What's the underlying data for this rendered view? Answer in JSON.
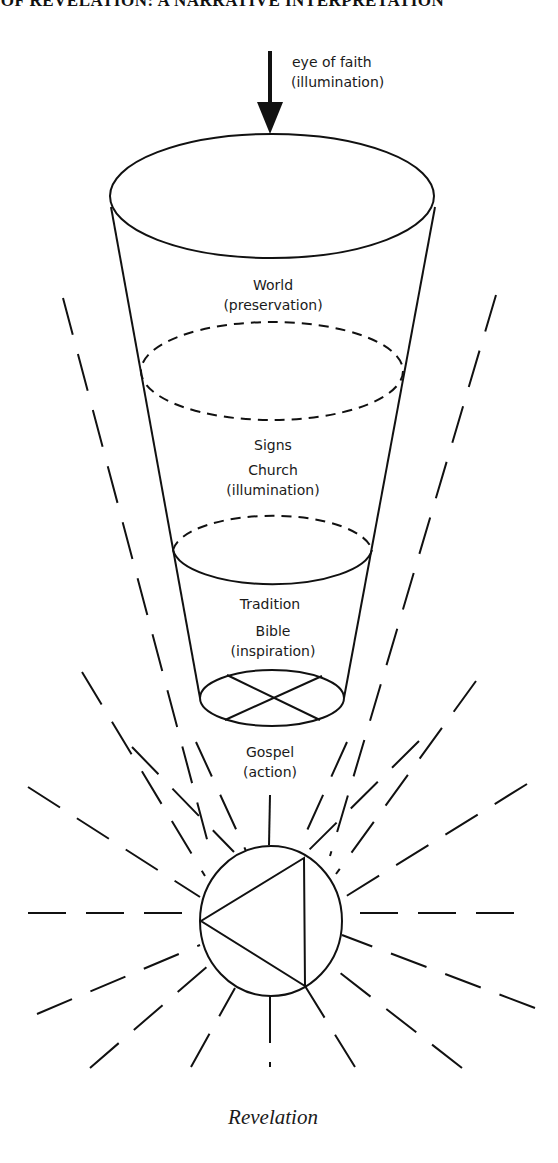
{
  "header": {
    "text": "S OF REVELATION: A NARRATIVE INTERPRETATION"
  },
  "arrow": {
    "line1": "eye of faith",
    "line2": "(illumination)"
  },
  "levels": [
    {
      "line1": "World",
      "line2": "(preservation)"
    },
    {
      "line1": "Signs",
      "line2": "Church",
      "line3": "(illumination)"
    },
    {
      "line1": "Tradition",
      "line2": "Bible",
      "line3": "(inspiration)"
    },
    {
      "line1": "Gospel",
      "line2": "(action)"
    }
  ],
  "caption": "Revelation",
  "colors": {
    "ink": "#111111",
    "background": "#ffffff"
  }
}
